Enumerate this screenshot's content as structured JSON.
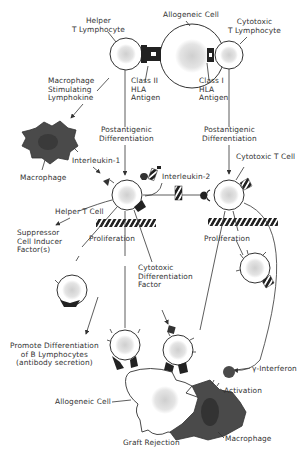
{
  "diagram": {
    "type": "cell-mediated immune response / graft rejection",
    "colors": {
      "line": "#3a3a3a",
      "cell_fill": "#ffffff",
      "nucleus": "#d8d8d8",
      "macrophage": "#4a4a4a",
      "receptor": "#222222"
    },
    "labels": {
      "allogeneic_cell_top": "Allogeneic Cell",
      "helper_t_lymphocyte": "Helper\nT Lymphocyte",
      "cytotoxic_t_lymphocyte": "Cytotoxic\nT Lymphocyte",
      "class_ii_hla": "Class II\nHLA\nAntigen",
      "class_i_hla": "Class I\nHLA\nAntigen",
      "macrophage_stimulating": "Macrophage\nStimulating\nLymphokine",
      "postantigenic_left": "Postantigenic\nDifferentiation",
      "postantigenic_right": "Postantigenic\nDifferentiation",
      "macrophage_top": "Macrophage",
      "interleukin_1": "Interleukin-1",
      "interleukin_2": "Interleukin-2",
      "cytotoxic_t_cell": "Cytotoxic T Cell",
      "helper_t_cell": "Helper T Cell",
      "suppressor": "Suppressor\nCell Inducer\nFactor(s)",
      "proliferation_left": "Proliferation",
      "proliferation_right": "Proliferation",
      "cytotoxic_diff_factor": "Cytotoxic\nDifferentiation\nFactor",
      "promote_b": "Promote Differentiation\nof B Lymphocytes\n(antibody secretion)",
      "gamma_interferon": "γ-Interferon",
      "activation": "Activation",
      "allogeneic_cell_bottom": "Allogeneic Cell",
      "macrophage_bottom": "Macrophage",
      "graft_rejection": "Graft Rejection"
    }
  }
}
